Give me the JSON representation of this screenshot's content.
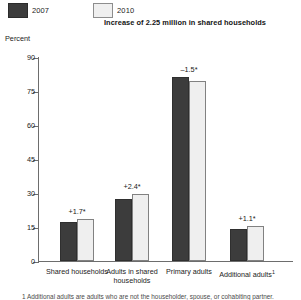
{
  "legend": {
    "items": [
      {
        "label": "2007",
        "swatch": "dark",
        "color": "#3c3c3c"
      },
      {
        "label": "2010",
        "swatch": "light",
        "color": "#efefef"
      }
    ]
  },
  "title": "Increase of 2.25 million in shared households",
  "axis": {
    "y_label": "Percent"
  },
  "footnote": "1 Additional adults are adults who are not the householder, spouse, or cohabiting partner.",
  "chart_data": {
    "type": "bar",
    "title": "Increase of 2.25 million in shared households",
    "xlabel": "",
    "ylabel": "Percent",
    "ylim": [
      0,
      90
    ],
    "yticks": [
      0,
      15,
      30,
      45,
      60,
      75,
      90
    ],
    "ytick_labels": [
      "0",
      "15",
      "30",
      "45",
      "60",
      "75",
      "90"
    ],
    "grid": false,
    "legend_position": "top-left",
    "categories": [
      "Shared households",
      "Adults in shared households",
      "Primary adults",
      "Additional adults¹"
    ],
    "series": [
      {
        "name": "2007",
        "values": [
          17.0,
          27.2,
          81.0,
          14.3
        ]
      },
      {
        "name": "2010",
        "values": [
          18.7,
          29.6,
          79.5,
          15.4
        ]
      }
    ],
    "annotations": [
      "+1.7*",
      "+2.4*",
      "–1.5*",
      "+1.1*"
    ]
  }
}
